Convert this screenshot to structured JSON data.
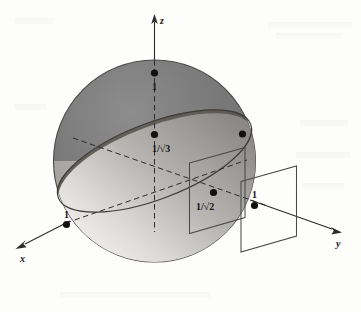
{
  "figure": {
    "background_color": "#fdfdfc",
    "axes": {
      "x": {
        "label": "x",
        "style": "solid-with-arrow",
        "direction": "down-left"
      },
      "y": {
        "label": "y",
        "style": "solid-with-arrow",
        "direction": "down-right"
      },
      "z": {
        "label": "z",
        "style": "solid-with-arrow",
        "direction": "up"
      }
    },
    "points": [
      {
        "id": "z-top",
        "label": "1",
        "label_position": "below-right",
        "note": "top of sphere on z axis"
      },
      {
        "id": "disc-upper",
        "label": "1/√3",
        "label_position": "below-right",
        "note": "point on z axis where tilted disc crosses"
      },
      {
        "id": "disc-rim",
        "label": "",
        "label_position": "none",
        "note": "unlabeled dot on upper-right rim of disc"
      },
      {
        "id": "x-front",
        "label": "1",
        "label_position": "above",
        "note": "point on x axis at lower-left rim of disc"
      },
      {
        "id": "plane-mid",
        "label": "1/√2",
        "label_position": "below-left",
        "note": "point where left vertical plane meets the disc"
      },
      {
        "id": "y-unit",
        "label": "1",
        "label_position": "above",
        "note": "point on y axis at the right vertical plane"
      }
    ],
    "labels": {
      "one": "1",
      "one_over_sqrt3": "1/√3",
      "one_over_sqrt2": "1/√2",
      "axis_x": "x",
      "axis_y": "y",
      "axis_z": "z"
    },
    "colors": {
      "sphere_dark": "#6e6e6e",
      "sphere_mid": "#8a8a8a",
      "sphere_light": "#d8d8d6",
      "disc_dark": "#5c5a58",
      "disc_light": "#e6e5e2",
      "outline": "#3a3a3a",
      "dot": "#111111",
      "plane_stroke": "#4a4a4a",
      "dash": "#2c2c2c"
    }
  }
}
